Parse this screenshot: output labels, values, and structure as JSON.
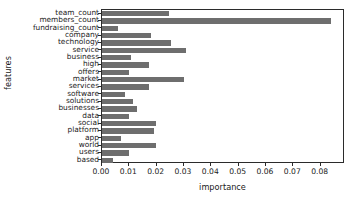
{
  "chart_data": {
    "type": "bar",
    "orientation": "horizontal",
    "title": "",
    "xlabel": "importance",
    "ylabel": "features",
    "xlim": [
      0.0,
      0.0889
    ],
    "grid": false,
    "legend": null,
    "bar_color": "#6e6e6e",
    "xticks": [
      "0.00",
      "0.01",
      "0.02",
      "0.03",
      "0.04",
      "0.05",
      "0.06",
      "0.07",
      "0.08"
    ],
    "xtick_values": [
      0.0,
      0.01,
      0.02,
      0.03,
      0.04,
      0.05,
      0.06,
      0.07,
      0.08
    ],
    "categories": [
      "team_count",
      "members_count",
      "fundraising_count",
      "company",
      "technology",
      "service",
      "business",
      "high",
      "offers",
      "market",
      "services",
      "software",
      "solutions",
      "businesses",
      "data",
      "social",
      "platform",
      "app",
      "world",
      "users",
      "based"
    ],
    "values": [
      0.0245,
      0.0836,
      0.0059,
      0.018,
      0.0252,
      0.0307,
      0.0106,
      0.0172,
      0.0099,
      0.03,
      0.0172,
      0.0084,
      0.0114,
      0.0128,
      0.0099,
      0.0197,
      0.019,
      0.007,
      0.0197,
      0.0099,
      0.004
    ]
  }
}
